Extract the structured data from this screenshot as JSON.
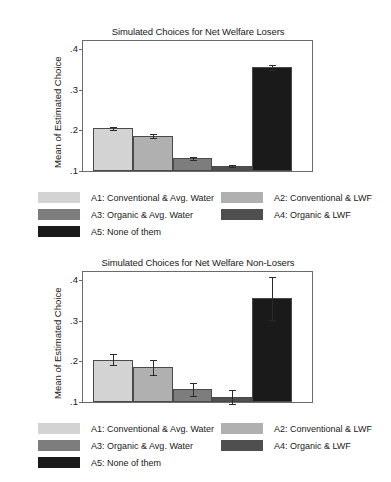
{
  "chart_data": [
    {
      "type": "bar",
      "title": "Simulated Choices for Net Welfare Losers",
      "xlabel": "",
      "ylabel": "Mean of Estimated Choice",
      "ylim": [
        0.1,
        0.42
      ],
      "yticks": [
        0.1,
        0.2,
        0.3,
        0.4
      ],
      "yticklabels": [
        ".1",
        ".2",
        ".3",
        ".4"
      ],
      "grid": false,
      "legend_position": "below",
      "categories": [
        "A1",
        "A2",
        "A3",
        "A4",
        "A5"
      ],
      "values": [
        0.205,
        0.186,
        0.131,
        0.112,
        0.355
      ],
      "errors": [
        0.004,
        0.004,
        0.004,
        0.003,
        0.006
      ],
      "colors": [
        "#d3d3d3",
        "#b0b0b0",
        "#7d7d7d",
        "#4f4f4f",
        "#1a1a1a"
      ]
    },
    {
      "type": "bar",
      "title": "Simulated Choices for Net Welfare Non-Losers",
      "xlabel": "",
      "ylabel": "Mean of Estimated Choice",
      "ylim": [
        0.1,
        0.42
      ],
      "yticks": [
        0.1,
        0.2,
        0.3,
        0.4
      ],
      "yticklabels": [
        ".1",
        ".2",
        ".3",
        ".4"
      ],
      "grid": false,
      "legend_position": "below",
      "categories": [
        "A1",
        "A2",
        "A3",
        "A4",
        "A5"
      ],
      "values": [
        0.204,
        0.185,
        0.131,
        0.112,
        0.355
      ],
      "errors": [
        0.014,
        0.018,
        0.016,
        0.018,
        0.052
      ],
      "colors": [
        "#d3d3d3",
        "#b0b0b0",
        "#7d7d7d",
        "#4f4f4f",
        "#1a1a1a"
      ]
    }
  ],
  "legend": {
    "entries": [
      {
        "label": "A1: Conventional & Avg. Water",
        "color": "#d3d3d3"
      },
      {
        "label": "A2: Conventional & LWF",
        "color": "#b0b0b0"
      },
      {
        "label": "A3: Organic & Avg. Water",
        "color": "#7d7d7d"
      },
      {
        "label": "A4: Organic & LWF",
        "color": "#4f4f4f"
      },
      {
        "label": "A5: None of them",
        "color": "#1a1a1a"
      }
    ]
  }
}
